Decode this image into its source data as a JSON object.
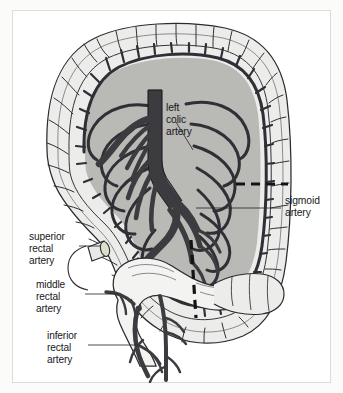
{
  "figure": {
    "kind": "anatomical-illustration",
    "frame": {
      "background_color": "#fbfbfa",
      "border_color": "#d8d8d4",
      "paper_color": "#ffffff"
    },
    "palette": {
      "vessel_dark": "#3b3b40",
      "vessel_outline": "#1d1d21",
      "mesentery_fill": "#b9b9b6",
      "bowel_fill": "#ececea",
      "bowel_outline": "#2a2a2e",
      "leader_line": "#2a2a2e",
      "dashed_line": "#141417",
      "label_text": "#17171a"
    }
  },
  "labels": [
    {
      "id": "left-colic-artery",
      "name": "left colic artery",
      "lines": [
        "left",
        "colic",
        "artery"
      ],
      "position": "interior-upper-center",
      "leader": "diagonal down-left to trunk branch"
    },
    {
      "id": "sigmoid-artery",
      "name": "sigmoid artery",
      "lines": [
        "sigmoid",
        "artery"
      ],
      "position": "right-outside",
      "leader": "horizontal left into mesentery"
    },
    {
      "id": "superior-rectal-artery",
      "name": "superior rectal artery",
      "lines": [
        "superior",
        "rectal",
        "artery"
      ],
      "position": "left-outside-upper",
      "leader": "horizontal right to cut vessel stump"
    },
    {
      "id": "middle-rectal-artery",
      "name": "middle rectal artery",
      "lines": [
        "middle",
        "rectal",
        "artery"
      ],
      "position": "left-outside-middle",
      "leader": "horizontal right to rectal vessel"
    },
    {
      "id": "inferior-rectal-artery",
      "name": "inferior rectal artery",
      "lines": [
        "inferior",
        "rectal",
        "artery"
      ],
      "position": "left-outside-lower",
      "leader": "horizontal right to lower rectal vessel"
    }
  ],
  "annotations": {
    "dashed_markers": [
      {
        "id": "dashed-horizontal-upper-right",
        "orientation": "horizontal"
      },
      {
        "id": "dashed-vertical-lower-center",
        "orientation": "vertical"
      }
    ]
  }
}
